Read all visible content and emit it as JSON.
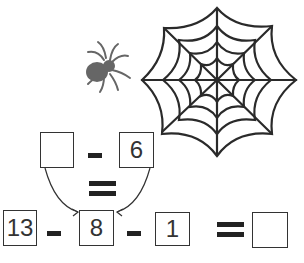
{
  "puzzle": {
    "top": {
      "blank": "",
      "operator": "-",
      "value": "6"
    },
    "middle_operator": "=",
    "bottom": {
      "a": "13",
      "op1": "-",
      "b": "8",
      "op2": "-",
      "c": "1",
      "equals": "=",
      "result": ""
    }
  },
  "decor": {
    "spider": "spider-icon",
    "web": "spider-web-icon"
  },
  "colors": {
    "ink": "#222222",
    "spider": "#666666"
  }
}
